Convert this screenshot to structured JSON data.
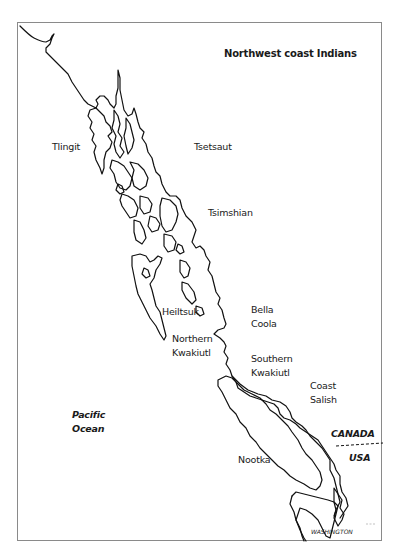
{
  "map": {
    "title": "Northwest coast Indians",
    "labels": {
      "tlingit": "Tlingit",
      "tsetsaut": "Tsetsaut",
      "tsimshian": "Tsimshian",
      "heiltsuk": "Heiltsuk",
      "bella_coola_1": "Bella",
      "bella_coola_2": "Coola",
      "northern_kwakiutl_1": "Northern",
      "northern_kwakiutl_2": "Kwakiutl",
      "southern_kwakiutl_1": "Southern",
      "southern_kwakiutl_2": "Kwakiutl",
      "coast_salish_1": "Coast",
      "coast_salish_2": "Salish",
      "nootka": "Nootka",
      "pacific_ocean_1": "Pacific",
      "pacific_ocean_2": "Ocean",
      "canada": "CANADA",
      "usa": "USA",
      "washington": "WASHINGTON"
    },
    "colors": {
      "coastline": "#111111",
      "frame": "#8a8a8a",
      "text": "#1a1a1a"
    }
  },
  "caption": {
    "text": ""
  }
}
